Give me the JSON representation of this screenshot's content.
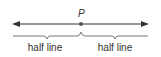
{
  "diagram": {
    "point_label": "P",
    "left_segment_label": "half line",
    "right_segment_label": "half line",
    "colors": {
      "line": "#333333",
      "point": "#555555",
      "brace": "#666666",
      "text": "#333333"
    }
  }
}
